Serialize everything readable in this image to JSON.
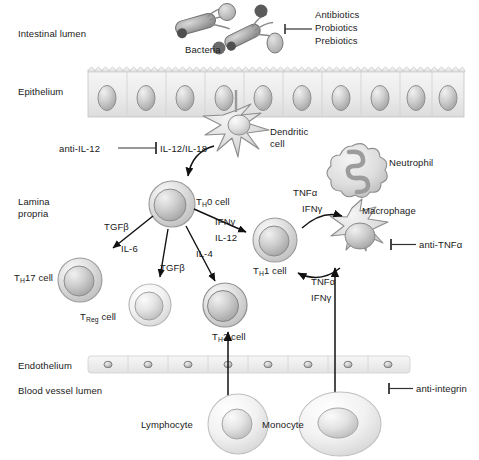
{
  "compartments": [
    {
      "key": "intestinal_lumen",
      "label": "Intestinal lumen"
    },
    {
      "key": "epithelium",
      "label": "Epithelium"
    },
    {
      "key": "lamina_propria",
      "label": "Lamina\npropria",
      "line1": "Lamina",
      "line2": "propria"
    },
    {
      "key": "endothelium",
      "label": "Endothelium"
    },
    {
      "key": "blood_vessel_lumen",
      "label": "Blood vessel lumen"
    }
  ],
  "cells": {
    "bacteria": "Bacteria",
    "dendritic_line1": "Dendritic",
    "dendritic_line2": "cell",
    "neutrophil": "Neutrophil",
    "macrophage": "Macrophage",
    "th0": "Tʜ0 cell",
    "th0_pre": "T",
    "th0_sub": "H",
    "th0_post": "0 cell",
    "th17_pre": "T",
    "th17_sub": "H",
    "th17_post": "17 cell",
    "treg_pre": "T",
    "treg_sub": "Reg",
    "treg_post": " cell",
    "th2_pre": "T",
    "th2_sub": "H",
    "th2_post": "2 cell",
    "th1_pre": "T",
    "th1_sub": "H",
    "th1_post": "1 cell",
    "lymphocyte": "Lymphocyte",
    "monocyte": "Monocyte"
  },
  "therapeutics": {
    "lumen_line1": "Antibiotics",
    "lumen_line2": "Probiotics",
    "lumen_line3": "Prebiotics",
    "anti_il12": "anti-IL-12",
    "anti_tnfa": "anti-TNFα",
    "anti_integrin": "anti-integrin"
  },
  "cytokines": {
    "il12_il18": "IL-12/IL-18",
    "tgfb_th17": "TGFβ",
    "il6": "IL-6",
    "tgfb_treg": "TGFβ",
    "il4": "IL-4",
    "ifng_th1": "IFNγ",
    "il12_th1": "IL-12",
    "tnfa_top": "TNFα",
    "ifng_top": "IFNγ",
    "tnfa_bottom": "TNFα",
    "ifng_bottom": "IFNγ"
  },
  "colors": {
    "tissue_fill": "#ededed",
    "cell_ring": "#c9c9c9",
    "nucleus": "#b6b6b6",
    "stroke": "#6e6e6e",
    "text": "#1a1a1a",
    "arrow": "#111111"
  }
}
